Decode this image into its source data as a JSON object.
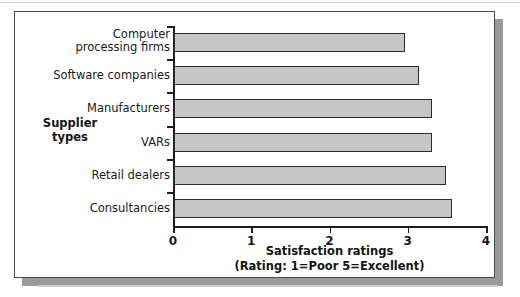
{
  "chart_data": {
    "type": "bar",
    "orientation": "horizontal",
    "title": "",
    "xlabel": "Satisfaction ratings",
    "xlabel_note": "(Rating: 1=Poor  5=Excellent)",
    "ylabel": "Supplier\ntypes",
    "xlim": [
      0,
      4
    ],
    "xticks": [
      "0",
      "1",
      "2",
      "3",
      "4"
    ],
    "xtick_values": [
      0,
      1,
      2,
      3,
      4
    ],
    "grid": false,
    "legend": null,
    "categories": [
      "Computer\nprocessing firms",
      "Software companies",
      "Manufacturers",
      "VARs",
      "Retail dealers",
      "Consultancies"
    ],
    "values": [
      2.95,
      3.13,
      3.3,
      3.3,
      3.48,
      3.55
    ],
    "series": [
      {
        "name": "Satisfaction ratings",
        "values": [
          2.95,
          3.13,
          3.3,
          3.3,
          3.48,
          3.55
        ]
      }
    ],
    "colors": {
      "bar_fill": "#c6c6c6",
      "bar_border": "#2b2b2b",
      "axis": "#1e1e1e",
      "text": "#1a1a1a",
      "panel_background": "#ffffff",
      "panel_border": "#4a4a4a",
      "panel_shadow": "#9a9a9a"
    }
  }
}
